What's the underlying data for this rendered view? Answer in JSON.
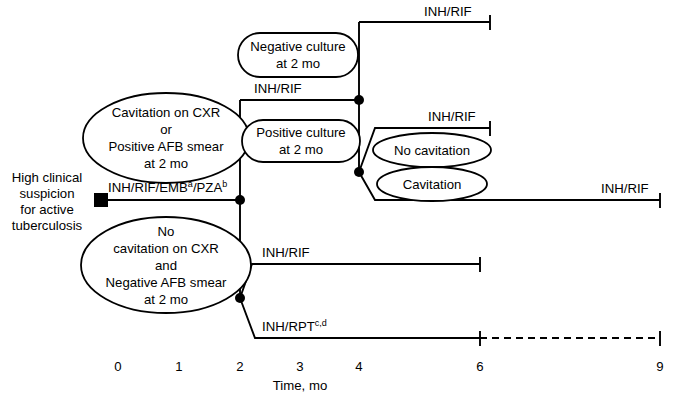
{
  "figure": {
    "type": "clinical-algorithm-timeline",
    "axis": {
      "title": "Time, mo",
      "ticks": [
        {
          "label": "0",
          "x": 118
        },
        {
          "label": "1",
          "x": 179
        },
        {
          "label": "2",
          "x": 240
        },
        {
          "label": "3",
          "x": 300
        },
        {
          "label": "4",
          "x": 359
        },
        {
          "label": "6",
          "x": 480
        },
        {
          "label": "9",
          "x": 660
        }
      ]
    },
    "start_node": {
      "label_line1": "High clinical",
      "label_line2": "suspicion",
      "label_line3": "for active",
      "label_line4": "tuberculosis"
    },
    "initial_phase": {
      "label_main": "INH/RIF/EMB",
      "label_sup1": "a",
      "label_mid": "/PZA",
      "label_sup2": "b"
    },
    "branches": {
      "upper_criteria": {
        "line1": "Cavitation on CXR",
        "line2": "or",
        "line3": "Positive AFB smear",
        "line4": "at 2 mo"
      },
      "lower_criteria": {
        "line1": "No",
        "line2": "cavitation on CXR",
        "line3": "and",
        "line4": "Negative AFB smear",
        "line5": "at 2 mo"
      },
      "negative_culture": {
        "line1": "Negative culture",
        "line2": "at 2 mo"
      },
      "positive_culture": {
        "line1": "Positive culture",
        "line2": "at 2 mo"
      },
      "no_cavitation": {
        "line1": "No cavitation"
      },
      "cavitation": {
        "line1": "Cavitation"
      }
    },
    "regimen_labels": {
      "mid_inh_rif": "INH/RIF",
      "top_inh_rif": "INH/RIF",
      "no_cav_inh_rif": "INH/RIF",
      "cav_inh_rif": "INH/RIF",
      "lower_inh_rif": "INH/RIF",
      "inh_rpt_main": "INH/RPT",
      "inh_rpt_sup": "c,d"
    },
    "colors": {
      "line": "#000000",
      "background": "#ffffff",
      "text": "#000000"
    }
  }
}
